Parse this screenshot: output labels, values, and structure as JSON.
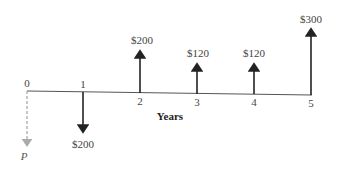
{
  "diagram": {
    "type": "cash-flow-diagram",
    "axis_label": "Years",
    "periods": [
      "0",
      "1",
      "2",
      "3",
      "4",
      "5"
    ],
    "unknown_label": "P",
    "flows": [
      {
        "period": "0",
        "amount": "P",
        "direction": "down",
        "style": "dashed"
      },
      {
        "period": "1",
        "amount": "$200",
        "direction": "down",
        "style": "solid"
      },
      {
        "period": "2",
        "amount": "$200",
        "direction": "up",
        "style": "solid"
      },
      {
        "period": "3",
        "amount": "$120",
        "direction": "up",
        "style": "solid"
      },
      {
        "period": "4",
        "amount": "$120",
        "direction": "up",
        "style": "solid"
      },
      {
        "period": "5",
        "amount": "$300",
        "direction": "up",
        "style": "solid"
      }
    ],
    "colors": {
      "line": "#444444",
      "dashed": "#aaaaaa"
    }
  }
}
